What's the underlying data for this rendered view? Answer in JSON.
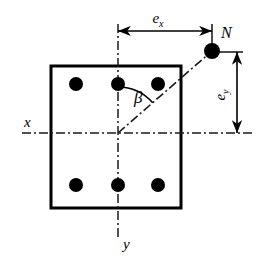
{
  "figure": {
    "background_color": "#ffffff",
    "line_color": "#000000",
    "width": 269,
    "height": 259
  },
  "labels": {
    "axis_x": "x",
    "axis_y": "y",
    "node": "N",
    "angle": "β",
    "ecc_x_base": "e",
    "ecc_x_sub": "x",
    "ecc_y_base": "e",
    "ecc_y_sub": "y"
  },
  "geometry": {
    "origin": {
      "x": 118,
      "y": 133
    },
    "section": {
      "x": 51,
      "y": 66,
      "width": 130,
      "height": 142,
      "stroke_width": 3
    },
    "node_point": {
      "x": 212,
      "y": 51,
      "radius": 8
    },
    "rebar_radius": 7,
    "rebar_dots": [
      {
        "x": 76,
        "y": 84
      },
      {
        "x": 118,
        "y": 84
      },
      {
        "x": 158,
        "y": 84
      },
      {
        "x": 76,
        "y": 185
      },
      {
        "x": 118,
        "y": 185
      },
      {
        "x": 158,
        "y": 185
      }
    ],
    "axis_x_line": {
      "x1": 22,
      "y1": 133,
      "x2": 252,
      "y2": 133
    },
    "axis_y_line": {
      "x1": 118,
      "y1": 24,
      "x2": 118,
      "y2": 240
    },
    "diagonal": {
      "x1": 118,
      "y1": 133,
      "x2": 212,
      "y2": 51
    },
    "dim_ex": {
      "x1": 118,
      "y1": 31,
      "x2": 212,
      "y2": 31
    },
    "dim_ey": {
      "x1": 237,
      "y1": 52,
      "x2": 237,
      "y2": 133
    },
    "ext_ex_right": {
      "x1": 212,
      "y1": 24,
      "x2": 212,
      "y2": 45
    },
    "ext_ey_top": {
      "x1": 212,
      "y1": 52,
      "x2": 243,
      "y2": 52
    },
    "angle_arc_radius": 46,
    "label_positions": {
      "axis_x": {
        "x": 24,
        "y": 127
      },
      "axis_y": {
        "x": 123,
        "y": 249
      },
      "node": {
        "x": 221,
        "y": 38
      },
      "angle": {
        "x": 134,
        "y": 103
      },
      "ecc_x": {
        "x": 158,
        "y": 23
      },
      "ecc_y": {
        "x": 225,
        "y": 95
      }
    }
  }
}
